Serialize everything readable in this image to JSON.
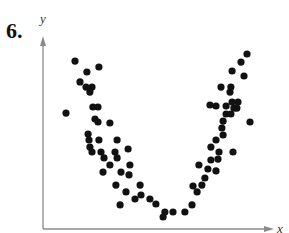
{
  "problem": {
    "number": "6."
  },
  "chart_data": {
    "type": "scatter",
    "title": "",
    "xlabel": "x",
    "ylabel": "y",
    "xlim": [
      0,
      10
    ],
    "ylim": [
      0,
      10
    ],
    "grid": false,
    "legend": null,
    "ticks": {
      "x": [],
      "y": []
    },
    "colors": {
      "points": "#111111",
      "axes": "#8a8a8a"
    },
    "points": [
      {
        "x": 1.39,
        "y": 8.79
      },
      {
        "x": 2.43,
        "y": 8.48
      },
      {
        "x": 1.91,
        "y": 8.22
      },
      {
        "x": 1.61,
        "y": 7.7
      },
      {
        "x": 1.87,
        "y": 7.43
      },
      {
        "x": 2.13,
        "y": 7.43
      },
      {
        "x": 2.04,
        "y": 7.17
      },
      {
        "x": 2.17,
        "y": 6.39
      },
      {
        "x": 2.39,
        "y": 6.39
      },
      {
        "x": 1.0,
        "y": 6.07
      },
      {
        "x": 2.26,
        "y": 5.76
      },
      {
        "x": 2.39,
        "y": 5.6
      },
      {
        "x": 2.91,
        "y": 5.55
      },
      {
        "x": 1.96,
        "y": 4.97
      },
      {
        "x": 2.0,
        "y": 4.66
      },
      {
        "x": 2.43,
        "y": 4.66
      },
      {
        "x": 3.22,
        "y": 4.66
      },
      {
        "x": 2.04,
        "y": 4.29
      },
      {
        "x": 2.13,
        "y": 4.03
      },
      {
        "x": 2.52,
        "y": 4.03
      },
      {
        "x": 3.13,
        "y": 4.03
      },
      {
        "x": 2.65,
        "y": 3.72
      },
      {
        "x": 3.22,
        "y": 3.72
      },
      {
        "x": 2.91,
        "y": 3.35
      },
      {
        "x": 3.7,
        "y": 4.19
      },
      {
        "x": 2.61,
        "y": 2.98
      },
      {
        "x": 3.39,
        "y": 2.98
      },
      {
        "x": 3.78,
        "y": 3.35
      },
      {
        "x": 3.74,
        "y": 2.83
      },
      {
        "x": 3.17,
        "y": 2.3
      },
      {
        "x": 3.61,
        "y": 1.94
      },
      {
        "x": 4.22,
        "y": 2.3
      },
      {
        "x": 3.35,
        "y": 1.26
      },
      {
        "x": 4.0,
        "y": 1.57
      },
      {
        "x": 4.26,
        "y": 1.78
      },
      {
        "x": 4.65,
        "y": 1.57
      },
      {
        "x": 4.91,
        "y": 1.31
      },
      {
        "x": 5.3,
        "y": 0.89
      },
      {
        "x": 5.22,
        "y": 0.63
      },
      {
        "x": 5.65,
        "y": 0.89
      },
      {
        "x": 6.17,
        "y": 0.89
      },
      {
        "x": 6.48,
        "y": 1.26
      },
      {
        "x": 6.7,
        "y": 1.94
      },
      {
        "x": 6.52,
        "y": 2.25
      },
      {
        "x": 6.91,
        "y": 2.3
      },
      {
        "x": 7.04,
        "y": 2.67
      },
      {
        "x": 7.17,
        "y": 3.14
      },
      {
        "x": 7.52,
        "y": 3.04
      },
      {
        "x": 6.78,
        "y": 3.35
      },
      {
        "x": 7.3,
        "y": 3.61
      },
      {
        "x": 7.61,
        "y": 3.66
      },
      {
        "x": 7.3,
        "y": 4.29
      },
      {
        "x": 7.65,
        "y": 4.03
      },
      {
        "x": 7.52,
        "y": 4.66
      },
      {
        "x": 7.83,
        "y": 4.92
      },
      {
        "x": 7.78,
        "y": 5.29
      },
      {
        "x": 8.26,
        "y": 4.03
      },
      {
        "x": 7.83,
        "y": 5.65
      },
      {
        "x": 7.96,
        "y": 6.02
      },
      {
        "x": 8.17,
        "y": 6.02
      },
      {
        "x": 7.52,
        "y": 6.44
      },
      {
        "x": 7.96,
        "y": 6.44
      },
      {
        "x": 8.3,
        "y": 6.33
      },
      {
        "x": 8.43,
        "y": 6.33
      },
      {
        "x": 7.26,
        "y": 6.49
      },
      {
        "x": 8.22,
        "y": 6.65
      },
      {
        "x": 8.48,
        "y": 6.65
      },
      {
        "x": 8.13,
        "y": 7.17
      },
      {
        "x": 9.0,
        "y": 5.6
      },
      {
        "x": 8.17,
        "y": 7.43
      },
      {
        "x": 7.74,
        "y": 7.43
      },
      {
        "x": 8.74,
        "y": 8.01
      },
      {
        "x": 8.22,
        "y": 8.27
      },
      {
        "x": 8.61,
        "y": 8.74
      },
      {
        "x": 8.87,
        "y": 9.16
      }
    ]
  }
}
